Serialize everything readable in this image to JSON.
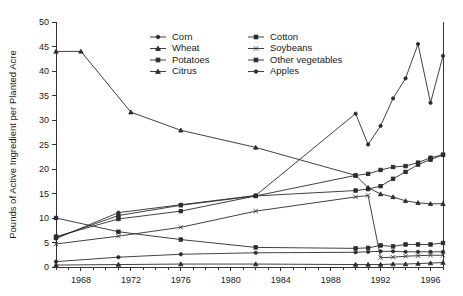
{
  "chart_data": {
    "type": "line",
    "title": "",
    "xlabel": "",
    "ylabel": "Pounds of Active Ingredient per Planted Acre",
    "xlim": [
      1966,
      1997
    ],
    "ylim": [
      0,
      50
    ],
    "yticks": [
      0,
      5,
      10,
      15,
      20,
      25,
      30,
      35,
      40,
      45,
      50
    ],
    "ytick_labels": [
      "0",
      "5",
      "10",
      "15",
      "20",
      "25",
      "30",
      "35",
      "40",
      "45",
      "50"
    ],
    "xticks": [
      1968,
      1972,
      1976,
      1980,
      1984,
      1988,
      1992,
      1996
    ],
    "xtick_labels": [
      "1968",
      "1972",
      "1976",
      "1980",
      "1984",
      "1988",
      "1992",
      "1996"
    ],
    "xminor_step": 1,
    "grid": false,
    "legend_position": "top-center",
    "series": [
      {
        "name": "Corn",
        "marker": "circle",
        "x": [
          1966,
          1971,
          1976,
          1982,
          1990,
          1991,
          1992,
          1993,
          1994,
          1995,
          1996,
          1997
        ],
        "values": [
          1.1,
          2.0,
          2.6,
          2.9,
          3.0,
          3.1,
          3.2,
          3.2,
          3.1,
          3.1,
          3.1,
          3.1
        ]
      },
      {
        "name": "Wheat",
        "marker": "triangle",
        "x": [
          1966,
          1971,
          1976,
          1982,
          1990,
          1991,
          1992,
          1993,
          1994,
          1995,
          1996,
          1997
        ],
        "values": [
          0.4,
          0.5,
          0.6,
          0.6,
          0.5,
          0.5,
          0.5,
          0.6,
          0.6,
          0.7,
          0.8,
          0.9
        ]
      },
      {
        "name": "Potatoes",
        "marker": "square",
        "x": [
          1966,
          1971,
          1976,
          1982,
          1990,
          1991,
          1992,
          1993,
          1994,
          1995,
          1996,
          1997
        ],
        "values": [
          6.2,
          9.8,
          11.4,
          14.5,
          18.7,
          19.0,
          19.8,
          20.4,
          20.6,
          21.3,
          22.3,
          22.9
        ]
      },
      {
        "name": "Citrus",
        "marker": "triangle",
        "x": [
          1966,
          1968,
          1972,
          1976,
          1982,
          1990,
          1991,
          1992,
          1993,
          1994,
          1995,
          1996,
          1997
        ],
        "values": [
          44.0,
          44.0,
          31.6,
          27.9,
          24.4,
          18.7,
          16.2,
          14.9,
          14.3,
          13.5,
          13.1,
          12.9,
          12.9
        ]
      },
      {
        "name": "Cotton",
        "marker": "square",
        "x": [
          1966,
          1971,
          1976,
          1982,
          1990,
          1991,
          1992,
          1993,
          1994,
          1995,
          1996,
          1997
        ],
        "values": [
          10.0,
          7.2,
          5.6,
          4.0,
          3.8,
          3.9,
          4.4,
          4.2,
          4.6,
          4.6,
          4.6,
          4.9
        ]
      },
      {
        "name": "Soybeans",
        "marker": "x",
        "x": [
          1966,
          1971,
          1976,
          1982,
          1990,
          1991,
          1992,
          1993,
          1994,
          1995,
          1996,
          1997
        ],
        "values": [
          4.7,
          6.3,
          8.1,
          11.4,
          14.3,
          14.6,
          1.9,
          2.0,
          2.2,
          2.3,
          2.4,
          2.4
        ]
      },
      {
        "name": "Other vegetables",
        "marker": "square",
        "x": [
          1966,
          1971,
          1976,
          1982,
          1990,
          1991,
          1992,
          1993,
          1994,
          1995,
          1996,
          1997
        ],
        "values": [
          6.0,
          10.5,
          12.6,
          14.5,
          15.6,
          15.9,
          16.5,
          18.0,
          19.4,
          20.9,
          21.9,
          22.9
        ]
      },
      {
        "name": "Apples",
        "marker": "circle",
        "x": [
          1966,
          1971,
          1976,
          1982,
          1990,
          1991,
          1992,
          1993,
          1994,
          1995,
          1996,
          1997
        ],
        "values": [
          5.8,
          11.1,
          12.7,
          14.6,
          31.3,
          25.0,
          28.8,
          34.4,
          38.5,
          45.5,
          33.5,
          43.1
        ]
      }
    ],
    "legend": {
      "column1": [
        "Corn",
        "Wheat",
        "Potatoes",
        "Citrus"
      ],
      "column2": [
        "Cotton",
        "Soybeans",
        "Other vegetables",
        "Apples"
      ]
    },
    "colors": {
      "line": "#2b2b2b",
      "axis": "#333333",
      "background": "#ffffff"
    }
  }
}
